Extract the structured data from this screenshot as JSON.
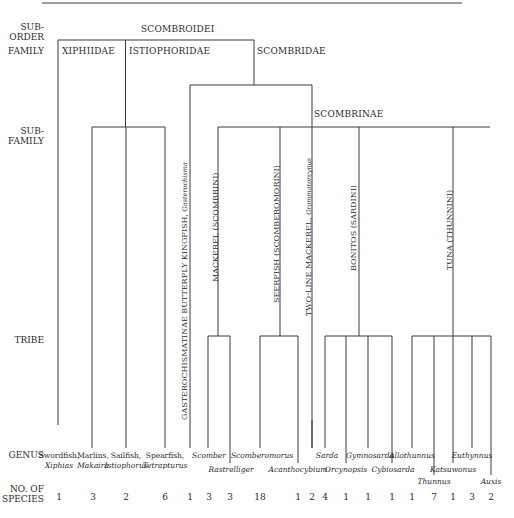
{
  "rank_labels": {
    "suborder": "SUB-\nORDER",
    "suborder_line1": "SUB-",
    "suborder_line2": "ORDER",
    "family": "FAMILY",
    "subfamily_line1": "SUB-",
    "subfamily_line2": "FAMILY",
    "tribe": "TRIBE",
    "genus": "GENUS",
    "species_line1": "NO. OF",
    "species_line2": "SPECIES"
  },
  "taxa": {
    "suborder": "SCOMBROIDEI",
    "families": [
      "XIPHIIDAE",
      "ISTIOPHORIDAE",
      "SCOMBRIDAE"
    ],
    "subfamily": "SCOMBRINAE",
    "gasterochismatinae": {
      "label": "GASTEROCHISMATINAE BUTTERFLY KINGFISH, ",
      "genus": "Gasterochisma"
    },
    "tribes": [
      {
        "label": "MACKEREL (SCOMBRINI)"
      },
      {
        "label": "SEERFISH (SCOMBEROMORINI)"
      },
      {
        "label": "TWO-LINE MACKEREL, ",
        "genus": "Grammatorcynus"
      },
      {
        "label": "BONITOS (SARDINI)"
      },
      {
        "label": "TUNA (THUNNINI)"
      }
    ]
  },
  "leaves": [
    {
      "common": "Swordfish,",
      "genus": "Xiphias",
      "species": "1"
    },
    {
      "common": "Marlins,",
      "genus": "Makaira",
      "species": "3"
    },
    {
      "common": "Sailfish,",
      "genus": "Istiophorus",
      "species": "2"
    },
    {
      "common": "Spearfish,",
      "genus": "Tetrapturus",
      "species": "6"
    },
    {
      "common": "",
      "genus": "",
      "species": "1"
    },
    {
      "common": "",
      "genus": "Scomber",
      "species": "3"
    },
    {
      "common": "",
      "genus": "Rastrelliger",
      "species": "3"
    },
    {
      "common": "",
      "genus": "Scomberomorus",
      "species": "18"
    },
    {
      "common": "",
      "genus": "Acanthocybium",
      "species": "1"
    },
    {
      "common": "",
      "genus": "",
      "species": "2"
    },
    {
      "common": "",
      "genus": "Sarda",
      "species": "4"
    },
    {
      "common": "",
      "genus": "Orcynopsis",
      "species": "1"
    },
    {
      "common": "",
      "genus": "Gymnosarda",
      "species": "1"
    },
    {
      "common": "",
      "genus": "Cybiosarda",
      "species": "1"
    },
    {
      "common": "",
      "genus": "Allothunnus",
      "species": "1"
    },
    {
      "common": "",
      "genus": "Thunnus",
      "species": "7"
    },
    {
      "common": "",
      "genus": "Katsuwonus",
      "species": "1"
    },
    {
      "common": "",
      "genus": "Euthynnus",
      "species": "3"
    },
    {
      "common": "",
      "genus": "Auxis",
      "species": "2"
    }
  ],
  "colors": {
    "line": "#3a3a3a",
    "text": "#2a2a2a",
    "background": "#ffffff"
  }
}
